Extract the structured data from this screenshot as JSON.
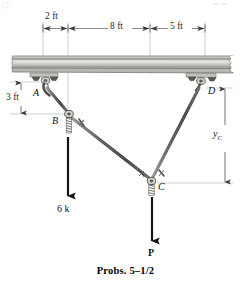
{
  "figure": {
    "caption": "Probs. 5–1/2",
    "dimensions": {
      "span_a": "2 ft",
      "span_b": "8 ft",
      "span_c": "5 ft",
      "drop_ab": "3 ft",
      "vertical_c": "y",
      "vertical_c_sub": "C"
    },
    "nodes": [
      {
        "id": "A",
        "label": "A",
        "x": 43,
        "y": 92
      },
      {
        "id": "B",
        "label": "B",
        "x": 68,
        "y": 113
      },
      {
        "id": "C",
        "label": "C",
        "x": 151,
        "y": 181
      },
      {
        "id": "D",
        "label": "D",
        "x": 205,
        "y": 92
      }
    ],
    "loads": [
      {
        "id": "load-6k",
        "label": "6 k",
        "x": 68,
        "from_y": 137,
        "to_y": 196
      },
      {
        "id": "load-P",
        "label": "P",
        "x": 152,
        "from_y": 196,
        "to_y": 241
      }
    ],
    "beam": {
      "left": 12,
      "right": 233,
      "top": 56,
      "bottom": 73
    },
    "dimension_line_y": 28,
    "ticks_x": [
      43,
      68,
      150,
      205
    ],
    "colors": {
      "beam_fill": "#c9c9c4",
      "beam_edge": "#6d6d68",
      "member": "#4a4a4a",
      "guide": "#a9a9a9",
      "text": "#111111"
    }
  }
}
